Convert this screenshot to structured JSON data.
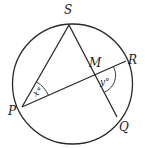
{
  "diagram": {
    "type": "circle-geometry",
    "points": {
      "S": {
        "label": "S",
        "on_circle": true
      },
      "P": {
        "label": "P",
        "on_circle": true
      },
      "R": {
        "label": "R",
        "on_circle": true
      },
      "Q": {
        "label": "Q",
        "on_circle": true
      },
      "M": {
        "label": "M",
        "on_circle": false,
        "is_intersection_of": [
          "PR",
          "SQ"
        ]
      }
    },
    "segments": [
      "PS",
      "PR",
      "SQ"
    ],
    "angles": [
      {
        "vertex": "P",
        "between": [
          "S",
          "R"
        ],
        "label": "x°"
      },
      {
        "vertex": "M",
        "between": [
          "R",
          "Q"
        ],
        "label": "y°"
      }
    ],
    "stroke_color": "#2a2a2a",
    "background": "#ffffff"
  }
}
